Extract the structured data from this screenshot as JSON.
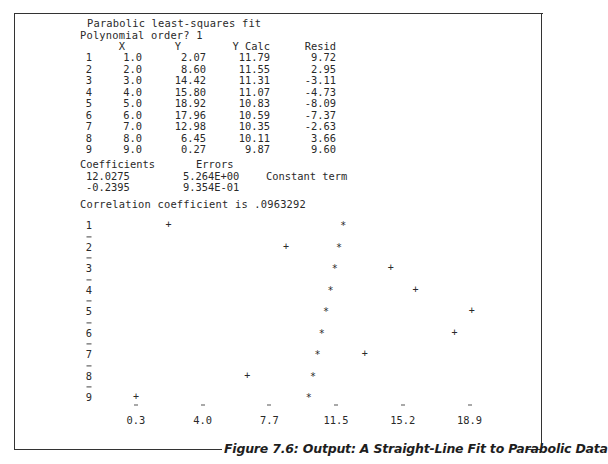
{
  "header": {
    "title": "Parabolic least-squares fit",
    "prompt": "Polynomial order? 1"
  },
  "table": {
    "columns": [
      "",
      "X",
      "Y",
      "Y Calc",
      "Resid"
    ],
    "rows": [
      {
        "i": "1",
        "x": "1.0",
        "y": "2.07",
        "calc": "11.79",
        "resid": "9.72"
      },
      {
        "i": "2",
        "x": "2.0",
        "y": "8.60",
        "calc": "11.55",
        "resid": "2.95"
      },
      {
        "i": "3",
        "x": "3.0",
        "y": "14.42",
        "calc": "11.31",
        "resid": "-3.11"
      },
      {
        "i": "4",
        "x": "4.0",
        "y": "15.80",
        "calc": "11.07",
        "resid": "-4.73"
      },
      {
        "i": "5",
        "x": "5.0",
        "y": "18.92",
        "calc": "10.83",
        "resid": "-8.09"
      },
      {
        "i": "6",
        "x": "6.0",
        "y": "17.96",
        "calc": "10.59",
        "resid": "-7.37"
      },
      {
        "i": "7",
        "x": "7.0",
        "y": "12.98",
        "calc": "10.35",
        "resid": "-2.63"
      },
      {
        "i": "8",
        "x": "8.0",
        "y": "6.45",
        "calc": "10.11",
        "resid": "3.66"
      },
      {
        "i": "9",
        "x": "9.0",
        "y": "0.27",
        "calc": "9.87",
        "resid": "9.60"
      }
    ]
  },
  "coefficients": {
    "header_coef": "Coefficients",
    "header_err": "Errors",
    "rows": [
      {
        "coef": "12.0275",
        "err": "5.264E+00",
        "note": "Constant term"
      },
      {
        "coef": "-0.2395",
        "err": "9.354E-01",
        "note": ""
      }
    ]
  },
  "correlation": "Correlation coefficient is .0963292",
  "plot": {
    "row_labels": [
      "1",
      "2",
      "3",
      "4",
      "5",
      "6",
      "7",
      "8",
      "9"
    ],
    "x_tick_labels": [
      "0.3",
      "4.0",
      "7.7",
      "11.5",
      "15.2",
      "18.9"
    ],
    "data_marker": "+",
    "fit_marker": "*"
  },
  "caption": "Figure 7.6: Output: A Straight-Line Fit to Parabolic Data",
  "chart_data": {
    "type": "scatter",
    "x": [
      1,
      2,
      3,
      4,
      5,
      6,
      7,
      8,
      9
    ],
    "series": [
      {
        "name": "Y (data, +)",
        "values": [
          2.07,
          8.6,
          14.42,
          15.8,
          18.92,
          17.96,
          12.98,
          6.45,
          0.27
        ]
      },
      {
        "name": "Y Calc (fit, *)",
        "values": [
          11.79,
          11.55,
          11.31,
          11.07,
          10.83,
          10.59,
          10.35,
          10.11,
          9.87
        ]
      }
    ],
    "value_axis_ticks": [
      0.3,
      4.0,
      7.7,
      11.5,
      15.2,
      18.9
    ],
    "orientation": "rows = X (1..9) vertical, values horizontal",
    "coefficients": [
      12.0275,
      -0.2395
    ],
    "errors": [
      5.264,
      0.9354
    ],
    "correlation_coefficient": 0.0963292
  }
}
